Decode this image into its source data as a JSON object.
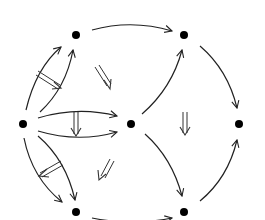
{
  "diagram": {
    "type": "2-categorical pasting diagram",
    "colors": {
      "stroke": "#222222",
      "node": "#000000",
      "background": "#ffffff"
    },
    "nodes": [
      {
        "id": "L",
        "x": 23,
        "y": 124
      },
      {
        "id": "TL",
        "x": 76,
        "y": 35
      },
      {
        "id": "TR",
        "x": 184,
        "y": 35
      },
      {
        "id": "C",
        "x": 131,
        "y": 124
      },
      {
        "id": "R",
        "x": 239,
        "y": 124
      },
      {
        "id": "BL",
        "x": 76,
        "y": 212
      },
      {
        "id": "BR",
        "x": 184,
        "y": 212
      }
    ],
    "edges": [
      {
        "from": "L",
        "to": "TL",
        "variant": "outer"
      },
      {
        "from": "L",
        "to": "TL",
        "variant": "inner"
      },
      {
        "from": "L",
        "to": "C",
        "variant": "upper"
      },
      {
        "from": "L",
        "to": "C",
        "variant": "lower"
      },
      {
        "from": "L",
        "to": "BL",
        "variant": "outer"
      },
      {
        "from": "L",
        "to": "BL",
        "variant": "inner"
      },
      {
        "from": "TL",
        "to": "TR"
      },
      {
        "from": "C",
        "to": "TR"
      },
      {
        "from": "C",
        "to": "BR"
      },
      {
        "from": "TR",
        "to": "R"
      },
      {
        "from": "BR",
        "to": "R"
      },
      {
        "from": "BL",
        "to": "BR"
      }
    ],
    "two_cells": [
      {
        "label": "L-TL 2-cell",
        "direction": "down-right"
      },
      {
        "label": "L-C 2-cell",
        "direction": "down"
      },
      {
        "label": "L-BL 2-cell",
        "direction": "down-left"
      },
      {
        "label": "TL-C triangle 2-cell",
        "direction": "down-right"
      },
      {
        "label": "C-BL triangle 2-cell",
        "direction": "down-left"
      },
      {
        "label": "right square 2-cell",
        "direction": "down"
      }
    ]
  }
}
